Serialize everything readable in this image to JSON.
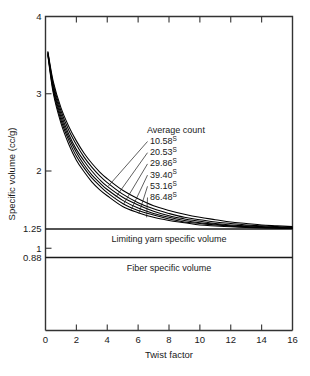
{
  "chart_data": {
    "type": "line",
    "title": "",
    "xlabel": "Twist factor",
    "ylabel": "Specific volume (cc/g)",
    "xlim": [
      0,
      16
    ],
    "ylim": [
      0.0,
      4.0
    ],
    "grid": false,
    "legend_position": "inside-upper-right",
    "legend_title": "Average count",
    "xticks": [
      0,
      2,
      4,
      6,
      8,
      10,
      12,
      14,
      16
    ],
    "xtick_labels": [
      "0",
      "2",
      "4",
      "6",
      "8",
      "10",
      "12",
      "14",
      "16"
    ],
    "yticks": [
      4,
      3,
      2,
      1.25,
      1,
      0.88
    ],
    "ytick_labels": [
      "4",
      "3",
      "2",
      "1.25",
      "1",
      "0.88"
    ],
    "reference_lines": [
      {
        "name": "limiting-yarn-specific-volume",
        "value": 1.25,
        "label": "Limiting yarn specific volume"
      },
      {
        "name": "fiber-specific-volume",
        "value": 0.88,
        "label": "Fiber specific volume"
      }
    ],
    "series": [
      {
        "name": "10.58s",
        "label": "10.58",
        "sup": "S",
        "x": [
          0.15,
          0.5,
          1,
          1.5,
          2,
          2.5,
          3,
          3.5,
          4,
          5,
          6,
          7,
          8,
          9,
          10,
          11,
          12,
          13,
          14,
          15,
          16
        ],
        "values": [
          3.55,
          3.16,
          2.82,
          2.58,
          2.39,
          2.23,
          2.1,
          1.99,
          1.9,
          1.75,
          1.64,
          1.55,
          1.49,
          1.44,
          1.4,
          1.37,
          1.34,
          1.32,
          1.3,
          1.29,
          1.28
        ]
      },
      {
        "name": "20.53s",
        "label": "20.53",
        "sup": "S",
        "x": [
          0.15,
          0.5,
          1,
          1.5,
          2,
          2.5,
          3,
          3.5,
          4,
          5,
          6,
          7,
          8,
          9,
          10,
          11,
          12,
          13,
          14,
          15,
          16
        ],
        "values": [
          3.54,
          3.13,
          2.78,
          2.53,
          2.34,
          2.18,
          2.05,
          1.94,
          1.85,
          1.7,
          1.59,
          1.51,
          1.45,
          1.4,
          1.37,
          1.34,
          1.32,
          1.3,
          1.29,
          1.28,
          1.27
        ]
      },
      {
        "name": "29.86s",
        "label": "29.86",
        "sup": "S",
        "x": [
          0.15,
          0.5,
          1,
          1.5,
          2,
          2.5,
          3,
          3.5,
          4,
          5,
          6,
          7,
          8,
          9,
          10,
          11,
          12,
          13,
          14,
          15,
          16
        ],
        "values": [
          3.53,
          3.1,
          2.74,
          2.48,
          2.28,
          2.13,
          2.0,
          1.89,
          1.8,
          1.66,
          1.56,
          1.48,
          1.42,
          1.38,
          1.35,
          1.32,
          1.3,
          1.29,
          1.28,
          1.27,
          1.265
        ]
      },
      {
        "name": "39.40s",
        "label": "39.40",
        "sup": "S",
        "x": [
          0.15,
          0.5,
          1,
          1.5,
          2,
          2.5,
          3,
          3.5,
          4,
          5,
          6,
          7,
          8,
          9,
          10,
          11,
          12,
          13,
          14,
          15,
          16
        ],
        "values": [
          3.52,
          3.07,
          2.7,
          2.44,
          2.24,
          2.08,
          1.95,
          1.85,
          1.76,
          1.62,
          1.52,
          1.45,
          1.4,
          1.36,
          1.33,
          1.31,
          1.29,
          1.28,
          1.27,
          1.265,
          1.26
        ]
      },
      {
        "name": "53.16s",
        "label": "53.16",
        "sup": "S",
        "x": [
          0.15,
          0.5,
          1,
          1.5,
          2,
          2.5,
          3,
          3.5,
          4,
          5,
          6,
          7,
          8,
          9,
          10,
          11,
          12,
          13,
          14,
          15,
          16
        ],
        "values": [
          3.51,
          3.04,
          2.66,
          2.4,
          2.19,
          2.04,
          1.91,
          1.81,
          1.72,
          1.58,
          1.49,
          1.43,
          1.38,
          1.34,
          1.32,
          1.3,
          1.285,
          1.275,
          1.268,
          1.262,
          1.258
        ]
      },
      {
        "name": "86.48s",
        "label": "86.48",
        "sup": "S",
        "x": [
          0.15,
          0.5,
          1,
          1.5,
          2,
          2.5,
          3,
          3.5,
          4,
          5,
          6,
          7,
          8,
          9,
          10,
          11,
          12,
          13,
          14,
          15,
          16
        ],
        "values": [
          3.5,
          3.01,
          2.62,
          2.35,
          2.14,
          1.99,
          1.86,
          1.76,
          1.68,
          1.54,
          1.46,
          1.4,
          1.36,
          1.33,
          1.3,
          1.288,
          1.278,
          1.27,
          1.264,
          1.258,
          1.255
        ]
      }
    ],
    "leader_anchors": [
      {
        "series": "10.58s",
        "x": 4.05,
        "y": 1.8
      },
      {
        "series": "20.53s",
        "x": 4.55,
        "y": 1.66
      },
      {
        "series": "29.86s",
        "x": 5.05,
        "y": 1.57
      },
      {
        "series": "39.40s",
        "x": 5.55,
        "y": 1.5
      },
      {
        "series": "53.16s",
        "x": 6.05,
        "y": 1.45
      },
      {
        "series": "86.48s",
        "x": 6.55,
        "y": 1.4
      }
    ]
  }
}
